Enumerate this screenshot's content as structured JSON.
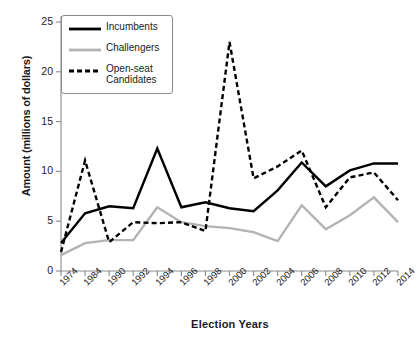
{
  "chart_data": {
    "type": "line",
    "title": "",
    "xlabel": "Election Years",
    "ylabel": "Amount (millions of dollars)",
    "categories": [
      "1974",
      "1984",
      "1990",
      "1992",
      "1994",
      "1996",
      "1998",
      "2000",
      "2002",
      "2004",
      "2006",
      "2008",
      "2010",
      "2012",
      "2014"
    ],
    "xlim": [
      0,
      14
    ],
    "ylim": [
      0,
      25
    ],
    "yticks": [
      0,
      5,
      10,
      15,
      20,
      25
    ],
    "grid": false,
    "legend_position": "top-left",
    "series": [
      {
        "name": "Incumbents",
        "style": "solid",
        "color": "#000000",
        "values": [
          2.8,
          5.8,
          6.5,
          6.3,
          12.3,
          6.4,
          6.9,
          6.3,
          6.0,
          8.1,
          10.9,
          8.5,
          10.1,
          10.8,
          10.8
        ]
      },
      {
        "name": "Challengers",
        "style": "solid",
        "color": "#b3b3b3",
        "values": [
          1.6,
          2.8,
          3.1,
          3.1,
          6.4,
          4.9,
          4.5,
          4.3,
          3.9,
          3.0,
          6.6,
          4.2,
          5.6,
          7.4,
          4.9
        ]
      },
      {
        "name": "Open-seat Candidates",
        "style": "dashed",
        "color": "#000000",
        "values": [
          1.9,
          11.1,
          2.9,
          4.9,
          4.8,
          4.9,
          4.0,
          23.0,
          9.3,
          10.5,
          12.1,
          6.4,
          9.4,
          9.9,
          7.1
        ]
      }
    ]
  },
  "legend": {
    "items": [
      {
        "label": "Incumbents",
        "style": "solid",
        "color": "#000000"
      },
      {
        "label": "Challengers",
        "style": "solid",
        "color": "#b3b3b3"
      },
      {
        "label": "Open-seat",
        "label2": "Candidates",
        "style": "dashed",
        "color": "#000000"
      }
    ]
  },
  "axes": {
    "y_title": "Amount (millions of dollars)",
    "x_title": "Election Years",
    "y_tick_labels": [
      "25",
      "20",
      "15",
      "10",
      "5",
      "0"
    ],
    "x_tick_labels": [
      "1974",
      "1984",
      "1990",
      "1992",
      "1994",
      "1996",
      "1998",
      "2000",
      "2002",
      "2004",
      "2006",
      "2008",
      "2010",
      "2012",
      "2014"
    ]
  }
}
